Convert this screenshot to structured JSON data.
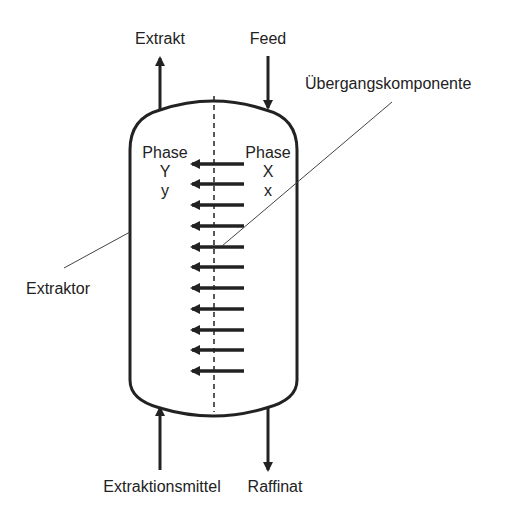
{
  "diagram": {
    "type": "extraction column schematic",
    "labels": {
      "extrakt": "Extrakt",
      "feed": "Feed",
      "uebergangskomponente": "Übergangskomponente",
      "extraktor": "Extraktor",
      "extraktionsmittel": "Extraktionsmittel",
      "raffinat": "Raffinat"
    },
    "phase_left": {
      "title": "Phase",
      "upper": "Y",
      "lower": "y"
    },
    "phase_right": {
      "title": "Phase",
      "upper": "X",
      "lower": "x"
    },
    "transfer_arrows": {
      "count": 11,
      "direction": "right-to-left"
    },
    "colors": {
      "stroke": "#222222",
      "leader": "#444444",
      "background": "#ffffff"
    }
  }
}
